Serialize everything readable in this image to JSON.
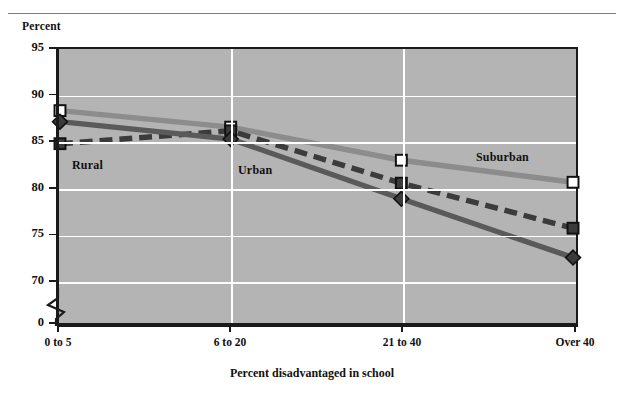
{
  "page": {
    "clipped_top_text": "·  ·        ·   ·          ·    ·",
    "y_axis_title": "Percent"
  },
  "chart_data": {
    "type": "line",
    "title": "",
    "xlabel": "Percent disadvantaged in school",
    "ylabel": "Percent",
    "categories": [
      "0 to 5",
      "6 to 20",
      "21 to 40",
      "Over 40"
    ],
    "ylim": [
      70,
      95
    ],
    "y_ticks": [
      "95",
      "90",
      "85",
      "80",
      "75",
      "70",
      "0"
    ],
    "y_tick_values": [
      95,
      90,
      85,
      80,
      75,
      70
    ],
    "axis_break": true,
    "grid": true,
    "legend_position": "inline-labels",
    "plot_background": "#b4b4b4",
    "series": [
      {
        "name": "Suburban",
        "values": [
          88.4,
          86.6,
          83.0,
          80.6
        ],
        "marker": "open-square",
        "marker_fill": "#ffffff",
        "line_style": "solid",
        "color": "#8c8c8c",
        "label_x": 476,
        "label_y": 150
      },
      {
        "name": "Rural",
        "values": [
          84.8,
          86.2,
          80.5,
          75.6
        ],
        "marker": "filled-square",
        "marker_fill": "#3b3b3b",
        "line_style": "dashed",
        "color": "#3b3b3b",
        "label_x": 72,
        "label_y": 158
      },
      {
        "name": "Urban",
        "values": [
          87.2,
          85.3,
          78.8,
          72.4
        ],
        "marker": "filled-diamond",
        "marker_fill": "#3b3b3b",
        "line_style": "solid",
        "color": "#5a5a5a",
        "label_x": 238,
        "label_y": 163
      }
    ]
  }
}
